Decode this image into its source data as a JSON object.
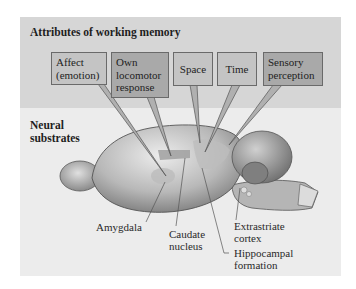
{
  "figure": {
    "top_panel_title": "Attributes of working memory",
    "bottom_panel_title": "Neural substrates"
  },
  "attributes": [
    {
      "label_line1": "Affect",
      "label_line2": "(emotion)",
      "label_line3": ""
    },
    {
      "label_line1": "Own",
      "label_line2": "locomotor",
      "label_line3": "response"
    },
    {
      "label_line1": "Space",
      "label_line2": "",
      "label_line3": ""
    },
    {
      "label_line1": "Time",
      "label_line2": "",
      "label_line3": ""
    },
    {
      "label_line1": "Sensory",
      "label_line2": "perception",
      "label_line3": ""
    }
  ],
  "substrates": [
    {
      "line1": "Amygdala",
      "line2": ""
    },
    {
      "line1": "Caudate",
      "line2": "nucleus"
    },
    {
      "line1": "Extrastriate",
      "line2": "cortex"
    },
    {
      "line1": "Hippocampal",
      "line2": "formation"
    }
  ],
  "colors": {
    "top_panel": "#d6d6d6",
    "bottom_panel": "#ececec",
    "box_light": "#c4c4c4",
    "box_dark": "#a9a9a9"
  }
}
